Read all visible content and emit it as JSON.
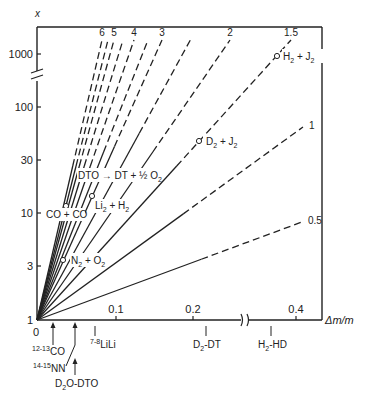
{
  "chart_data": {
    "type": "line",
    "title": "",
    "xlabel": "Δm/m",
    "ylabel": "x",
    "x_scale": "linear (broken between 0.2 and 0.4)",
    "y_scale": "log (broken between 100 and 1000)",
    "xlim": [
      0,
      0.42
    ],
    "ylim": [
      1,
      2000
    ],
    "x_ticks": [
      {
        "label": "0",
        "value": 0
      },
      {
        "label": "0.1",
        "value": 0.1
      },
      {
        "label": "0.2",
        "value": 0.2
      },
      {
        "label": "0.4",
        "value": 0.4
      }
    ],
    "y_ticks": [
      {
        "label": "1",
        "value": 1
      },
      {
        "label": "3",
        "value": 3
      },
      {
        "label": "10",
        "value": 10
      },
      {
        "label": "30",
        "value": 30
      },
      {
        "label": "100",
        "value": 100
      },
      {
        "label": "1000",
        "value": 1000
      }
    ],
    "grid": false,
    "legend": "none (lines labeled at ends)",
    "series": [
      {
        "name": "6",
        "labeled": true,
        "end": [
          102,
          40
        ],
        "dash_from": 0.55
      },
      {
        "name": "",
        "labeled": false,
        "end": [
          108,
          40
        ],
        "dash_from": 0.55
      },
      {
        "name": "5",
        "labeled": true,
        "end": [
          114,
          40
        ],
        "dash_from": 0.55
      },
      {
        "name": "",
        "labeled": false,
        "end": [
          123,
          40
        ],
        "dash_from": 0.55
      },
      {
        "name": "4",
        "labeled": true,
        "end": [
          134,
          40
        ],
        "dash_from": 0.55
      },
      {
        "name": "",
        "labeled": false,
        "end": [
          148,
          40
        ],
        "dash_from": 0.6
      },
      {
        "name": "3",
        "labeled": true,
        "end": [
          162,
          40
        ],
        "dash_from": 0.62
      },
      {
        "name": "",
        "labeled": false,
        "end": [
          192,
          37
        ],
        "dash_from": 0.66
      },
      {
        "name": "2",
        "labeled": true,
        "end": [
          230,
          40
        ],
        "dash_from": 0.6
      },
      {
        "name": "1.5",
        "labeled": true,
        "end": [
          291,
          40
        ],
        "dash_from": 0.55
      },
      {
        "name": "1",
        "labeled": true,
        "end": [
          303,
          127
        ],
        "dash_from": 0.55
      },
      {
        "name": "0.5",
        "labeled": true,
        "end": [
          302,
          222
        ],
        "dash_from": 0.62
      }
    ],
    "annotations": [
      {
        "text": "H₂ + J₂",
        "point": [
          277,
          55
        ]
      },
      {
        "text": "D₂ + J₂",
        "point": [
          199,
          140
        ]
      },
      {
        "text": "DTO → DT + ½ O₂",
        "point": null
      },
      {
        "text": "Li₂ + H₂",
        "point": [
          92,
          195
        ]
      },
      {
        "text": "CO + CO",
        "point": [
          66,
          205
        ]
      },
      {
        "text": "N₂ + O₂",
        "point": [
          63,
          260
        ]
      }
    ],
    "x_markers": [
      {
        "label": "¹²⁻¹³CO",
        "x": 53,
        "arrow": true
      },
      {
        "label": "¹⁴⁻¹⁵NN",
        "x": 75,
        "arrow": true
      },
      {
        "label": "D₂O-DTO",
        "x": 75,
        "arrow": true
      },
      {
        "label": "⁷⁻⁸LiLi",
        "x": 95,
        "arrow": false
      },
      {
        "label": "D₂-DT",
        "x": 206,
        "arrow": false
      },
      {
        "label": "H₂-HD",
        "x": 271,
        "arrow": false
      }
    ]
  },
  "labels": {
    "y_axis": "x",
    "x_axis": "Δm/m",
    "y1000": "1000",
    "y100": "100",
    "y30": "30",
    "y10": "10",
    "y3": "3",
    "y1": "1",
    "x0": "0",
    "x01": "0.1",
    "x02": "0.2",
    "x04": "0.4",
    "h2j2": "H",
    "d2j2": "D",
    "dto": "DTO → DT + ½ O",
    "li2h2": "Li",
    "coco": "CO + CO",
    "n2o2": "N",
    "m_co_pre": "12-13",
    "m_co": "CO",
    "m_nn_pre": "14-15",
    "m_nn": "NN",
    "m_d2o": "O-DTO",
    "m_lili_pre": "7-8",
    "m_lili": "LiLi",
    "m_d2dt": "-DT",
    "m_h2hd": "-HD"
  }
}
